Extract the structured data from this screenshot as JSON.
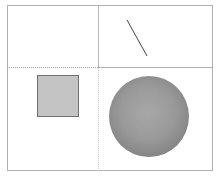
{
  "diagram": {
    "layout": "2x2 grid",
    "panels": [
      {
        "position": "top-left",
        "content": "empty"
      },
      {
        "position": "top-right",
        "content": "line",
        "shape": {
          "x1": 127,
          "y1": 20,
          "x2": 147,
          "y2": 56,
          "color": "#444444"
        }
      },
      {
        "position": "bottom-left",
        "content": "square",
        "shape": {
          "fill": "#c3c3c3",
          "stroke": "#6e6e6e"
        }
      },
      {
        "position": "bottom-right",
        "content": "circle",
        "shape": {
          "fill": "#999999"
        }
      }
    ],
    "colors": {
      "frame": "#b0b0b0",
      "background": "#ffffff"
    }
  }
}
